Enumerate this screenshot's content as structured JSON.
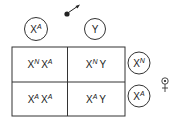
{
  "male": {
    "symbol": "male-symbol",
    "gametes": [
      {
        "base": "X",
        "sup": "A"
      },
      {
        "base": "Y",
        "sup": ""
      }
    ]
  },
  "female": {
    "symbol": "female-symbol",
    "gametes": [
      {
        "base": "X",
        "sup": "N"
      },
      {
        "base": "X",
        "sup": "A"
      }
    ]
  },
  "grid": [
    [
      {
        "a": "X",
        "asup": "N",
        "b": "X",
        "bsup": "A"
      },
      {
        "a": "X",
        "asup": "N",
        "b": "Y",
        "bsup": ""
      }
    ],
    [
      {
        "a": "X",
        "asup": "A",
        "b": "X",
        "bsup": "A"
      },
      {
        "a": "X",
        "asup": "A",
        "b": "Y",
        "bsup": ""
      }
    ]
  ]
}
